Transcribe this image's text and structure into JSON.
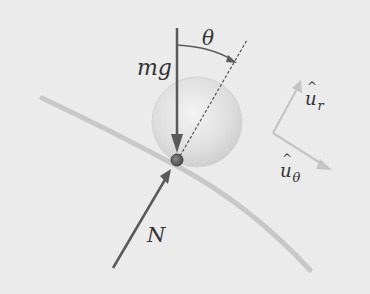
{
  "diagram": {
    "type": "free-body diagram",
    "labels": {
      "gravity": "mg",
      "angle": "θ",
      "normal": "N",
      "unit_r_base": "u",
      "unit_r_sub": "r",
      "unit_theta_base": "u",
      "unit_theta_sub": "θ"
    },
    "colors": {
      "background": "#ebebeb",
      "force_arrow": "#5a5a5a",
      "surface_curve": "#c8c8c8",
      "sphere_fill": "#dcdcdc",
      "bead": "#6e6e6e",
      "unit_vectors": "#c4c4c4",
      "dashed_line": "#555555"
    },
    "elements": [
      "curved surface",
      "translucent sphere",
      "bead on surface",
      "weight vector mg (downward)",
      "normal force N",
      "radial dashed line",
      "angle arc θ",
      "unit vector u_r",
      "unit vector u_θ"
    ]
  }
}
